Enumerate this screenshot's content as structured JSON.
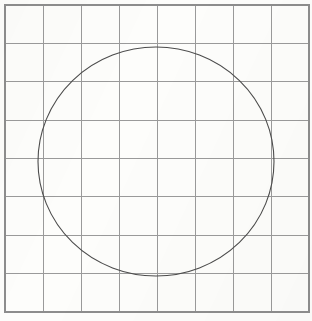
{
  "figure": {
    "canvas": {
      "width": 312,
      "height": 321
    },
    "background_color": "#fdfdfb"
  },
  "grid": {
    "name": "square-grid",
    "columns": 8,
    "rows": 8,
    "left": 5,
    "top": 5,
    "right": 309,
    "bottom": 312,
    "cell_width": 38.0,
    "cell_height": 38.375,
    "line_color": "#9a9a9a",
    "line_width": 1,
    "border_color": "#8d8d8d",
    "border_width": 1.2,
    "vertical_lines_x": [
      5,
      43,
      81,
      119,
      157,
      195,
      233,
      271,
      309
    ],
    "horizontal_lines_y": [
      5,
      43.4,
      81.8,
      120.1,
      158.5,
      196.9,
      235.3,
      273.6,
      312
    ]
  },
  "circle": {
    "name": "inscribed-circle",
    "center_x": 156,
    "center_y": 161,
    "radius": 118,
    "stroke_color": "#4c4c4c",
    "stroke_width": 1.1,
    "fill": "none",
    "leftmost_x": 38,
    "rightmost_x": 274,
    "topmost_y": 47,
    "bottommost_y": 276
  },
  "chart_data": {
    "type": "scatter",
    "subtitle": "",
    "xlabel": "",
    "ylabel": "",
    "xlim": [
      0,
      8
    ],
    "ylim": [
      0,
      8
    ],
    "grid": true,
    "legend": "none",
    "categories": [],
    "values": [],
    "annotations": [
      "8 by 8 square grid drawn with light gray rules",
      "A single circle is drawn centered on the grid",
      "Circle center sits at grid coordinate (3.97, 4.06) in cell units",
      "Circle radius spans approximately 3.1 grid cells",
      "Circle is not perfectly hand-drawn symmetric; slight ellipticity",
      "No axis tick labels, no legend, no numeric data labels present"
    ],
    "shapes": [
      {
        "shape": "rectangle",
        "role": "grid-border",
        "x": 5,
        "y": 5,
        "width": 304,
        "height": 307,
        "stroke": "#8d8d8d",
        "fill": "none"
      },
      {
        "shape": "circle",
        "role": "inscribed-circle",
        "cx": 156,
        "cy": 161,
        "r": 118,
        "stroke": "#4c4c4c",
        "fill": "none"
      }
    ]
  }
}
